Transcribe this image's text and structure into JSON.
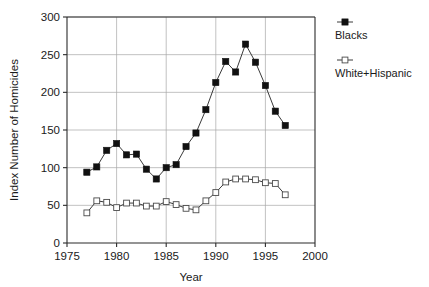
{
  "chart_data": {
    "type": "line",
    "title": "",
    "xlabel": "Year",
    "ylabel": "Index Number of Homicides",
    "xlim": [
      1975,
      2000
    ],
    "ylim": [
      0,
      300
    ],
    "xticks": [
      1975,
      1980,
      1985,
      1990,
      1995,
      2000
    ],
    "yticks": [
      0,
      50,
      100,
      150,
      200,
      250,
      300
    ],
    "grid": true,
    "legend_position": "right",
    "x": [
      1977,
      1978,
      1979,
      1980,
      1981,
      1982,
      1983,
      1984,
      1985,
      1986,
      1987,
      1988,
      1989,
      1990,
      1991,
      1992,
      1993,
      1994,
      1995,
      1996,
      1997
    ],
    "series": [
      {
        "name": "Blacks",
        "marker": "filled-square",
        "color": "#111111",
        "values": [
          94,
          101,
          123,
          132,
          117,
          118,
          98,
          85,
          100,
          104,
          128,
          146,
          177,
          213,
          241,
          227,
          264,
          240,
          209,
          175,
          156
        ]
      },
      {
        "name": "White+Hispanic",
        "marker": "open-square",
        "color": "#4a4a4a",
        "values": [
          40,
          56,
          54,
          47,
          53,
          53,
          49,
          49,
          55,
          51,
          46,
          44,
          56,
          67,
          81,
          85,
          85,
          84,
          80,
          79,
          64
        ]
      }
    ]
  },
  "axes": {
    "x_title": "Year",
    "y_title": "Index Number of Homicides",
    "x_tick_labels": [
      "1975",
      "1980",
      "1985",
      "1990",
      "1995",
      "2000"
    ],
    "y_tick_labels": [
      "0",
      "50",
      "100",
      "150",
      "200",
      "250",
      "300"
    ]
  },
  "legend": {
    "entries": [
      {
        "label": "Blacks",
        "marker": "filled-square"
      },
      {
        "label": "White+Hispanic",
        "marker": "open-square"
      }
    ]
  }
}
